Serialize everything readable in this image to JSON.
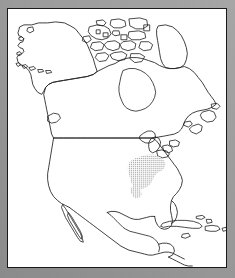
{
  "figure": {
    "kind": "distribution-map",
    "region_title": "North America",
    "panel_background": "#ffffff",
    "page_background": "#9a9a9a",
    "frame_color": "#1a1a1a",
    "outline_color": "#1d1d1d",
    "range_color": "#8c8c8c",
    "caption": "",
    "labels": []
  },
  "map": {
    "projection_note": "outline map, no graticule",
    "landmasses": [
      "Alaska",
      "Canada mainland",
      "Canadian Arctic Archipelago",
      "Greenland edge",
      "Newfoundland",
      "Nova Scotia",
      "Contiguous United States",
      "Mexico",
      "Baja California",
      "Central America",
      "Cuba",
      "Hispaniola",
      "Bahamas",
      "Vancouver Island",
      "Aleutian Islands"
    ],
    "internal_lines": [
      "United States - Canada border (49th parallel)",
      "United States - Mexico border",
      "Great Lakes shorelines",
      "Hudson Bay shoreline"
    ],
    "shaded_range": {
      "style": "stipple",
      "label": "distribution range",
      "approximate_extent": "Upper Mississippi Valley and Ohio Valley, north-central and east-central United States",
      "fill": "#8c8c8c"
    }
  }
}
